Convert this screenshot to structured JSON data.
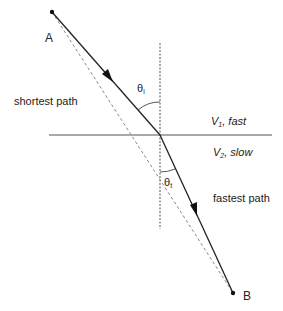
{
  "diagram": {
    "points": {
      "A": {
        "label": "A",
        "x": 52,
        "y": 12
      },
      "B": {
        "label": "B",
        "x": 233,
        "y": 293
      },
      "refraction": {
        "x": 160,
        "y": 135
      }
    },
    "labels": {
      "shortest_path": "shortest path",
      "fastest_path": "fastest path",
      "theta_i_symbol": "θ",
      "theta_i_sub": "i",
      "theta_t_symbol": "θ",
      "theta_t_sub": "t",
      "medium1_v": "V",
      "medium1_sub": "1",
      "medium1_desc": ", fast",
      "medium2_v": "V",
      "medium2_sub": "2",
      "medium2_desc": ", slow"
    },
    "colors": {
      "solid_line": "#222222",
      "dashed_line": "#888888",
      "interface": "#555555",
      "text": "#222222"
    }
  }
}
